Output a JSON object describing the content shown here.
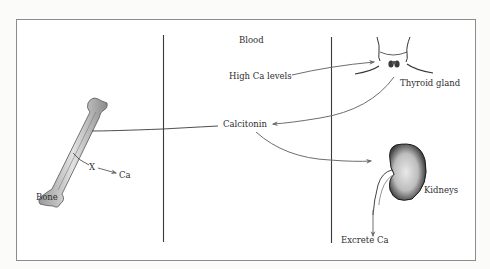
{
  "diagram": {
    "type": "calcium-regulation-flow",
    "compartments": [
      "Bone",
      "Blood",
      "Thyroid / Kidneys"
    ],
    "labels": {
      "blood": "Blood",
      "high_ca": "High Ca levels",
      "thyroid": "Thyroid gland",
      "calcitonin": "Calcitonin",
      "kidneys": "Kidneys",
      "excrete": "Excrete Ca",
      "bone": "Bone",
      "blocked": "X",
      "ca": "Ca"
    },
    "edges": [
      {
        "from": "High Ca levels",
        "to": "Thyroid gland"
      },
      {
        "from": "Thyroid gland",
        "to": "Calcitonin"
      },
      {
        "from": "Calcitonin",
        "to": "Bone"
      },
      {
        "from": "Calcitonin",
        "to": "Kidneys"
      },
      {
        "from": "Kidneys",
        "to": "Excrete Ca"
      },
      {
        "from": "Bone",
        "to": "Ca",
        "blocked": true
      }
    ],
    "colors": {
      "line": "#3a3a3a",
      "arrow": "#7a7a7a",
      "frame": "#8c8c8c",
      "bone": "#cfcfcf",
      "kidney": "#2c2c2c"
    }
  }
}
